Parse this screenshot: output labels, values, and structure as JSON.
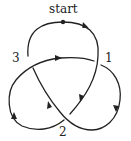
{
  "diagram": {
    "type": "trefoil-knot",
    "stroke_color": "#222222",
    "labels": {
      "start": "start",
      "crossing_1": "1",
      "crossing_2": "2",
      "crossing_3": "3"
    },
    "crossings": [
      {
        "label": "1",
        "over": "descending strand from top",
        "under": "horizontal strand"
      },
      {
        "label": "2",
        "over": "diagonal strand upper-left to lower-right",
        "under": "diagonal strand upper-right to lower-left"
      },
      {
        "label": "3",
        "over": "horizontal strand",
        "under": "descending strand from top"
      }
    ],
    "start_marker": "dot"
  }
}
